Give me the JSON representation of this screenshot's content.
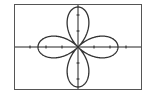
{
  "calculator_graph": {
    "description": "Polar graph of a four-petal rose",
    "equation": "r = cos(2θ)",
    "window": {
      "xmin": -1.5,
      "xmax": 1.5,
      "ymin": -1,
      "ymax": 1
    },
    "axes_tick_count_each_side": 3,
    "curve_color": "#333333",
    "axis_color": "#222222"
  }
}
